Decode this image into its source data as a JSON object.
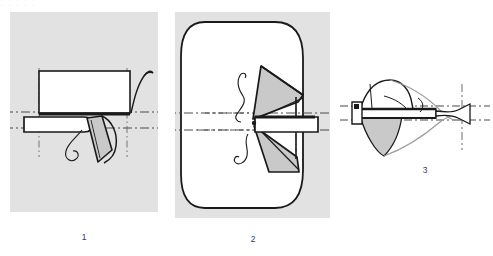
{
  "figure": {
    "type": "technical-line-drawing",
    "background_color": "#ffffff",
    "panel_background_color": "#e2e2e2",
    "line_color": "#1a1a1a",
    "fill_grey": "#c9c9c9",
    "fill_white": "#ffffff",
    "centerline_color": "#4a4a4a",
    "top_remnant_text": ".   .        .            .      .",
    "panels": [
      {
        "id": "panel-1",
        "caption": "1",
        "has_background": true,
        "x": 10,
        "y": 12,
        "width": 148,
        "height": 200,
        "description": "Side view: rectangular body above a horizontal bar, with a grey angled flap and curved leader lines"
      },
      {
        "id": "panel-2",
        "caption": "2",
        "has_background": true,
        "x": 175,
        "y": 12,
        "width": 155,
        "height": 206,
        "description": "Front view: large rounded-rectangle outline with grey wedge shapes converging at center and a horizontal bar at right"
      },
      {
        "id": "panel-3",
        "caption": "3",
        "has_background": false,
        "x": 340,
        "y": 78,
        "width": 150,
        "height": 92,
        "description": "Perspective view: grey conical body with horizontal bar and curved outline, vertical centerline at right"
      }
    ],
    "captions": [
      {
        "label": "1",
        "x": 64,
        "y": 232
      },
      {
        "label": "2",
        "x": 233,
        "y": 234
      },
      {
        "label": "3",
        "x": 405,
        "y": 165
      }
    ]
  }
}
